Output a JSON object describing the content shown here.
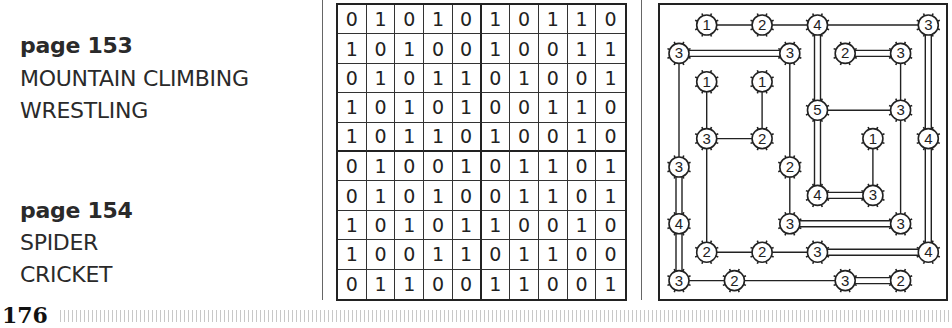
{
  "answers": [
    {
      "page_label": "page 153",
      "words": [
        "MOUNTAIN CLIMBING",
        "WRESTLING"
      ]
    },
    {
      "page_label": "page 154",
      "words": [
        "SPIDER",
        "CRICKET"
      ]
    }
  ],
  "binary_grid": [
    [
      "0",
      "1",
      "0",
      "1",
      "0",
      "1",
      "0",
      "1",
      "1",
      "0"
    ],
    [
      "1",
      "0",
      "1",
      "0",
      "0",
      "1",
      "0",
      "0",
      "1",
      "1"
    ],
    [
      "0",
      "1",
      "0",
      "1",
      "1",
      "0",
      "1",
      "0",
      "0",
      "1"
    ],
    [
      "1",
      "0",
      "1",
      "0",
      "1",
      "0",
      "0",
      "1",
      "1",
      "0"
    ],
    [
      "1",
      "0",
      "1",
      "1",
      "0",
      "1",
      "0",
      "0",
      "1",
      "0"
    ],
    [
      "0",
      "1",
      "0",
      "0",
      "1",
      "0",
      "1",
      "1",
      "0",
      "1"
    ],
    [
      "0",
      "1",
      "0",
      "1",
      "0",
      "0",
      "1",
      "1",
      "0",
      "1"
    ],
    [
      "1",
      "0",
      "1",
      "0",
      "1",
      "1",
      "0",
      "0",
      "1",
      "0"
    ],
    [
      "1",
      "0",
      "0",
      "1",
      "1",
      "0",
      "1",
      "1",
      "0",
      "0"
    ],
    [
      "0",
      "1",
      "1",
      "0",
      "0",
      "1",
      "1",
      "0",
      "0",
      "1"
    ]
  ],
  "bridges_puzzle": {
    "nodes": [
      {
        "id": "a",
        "col": 1,
        "row": 0,
        "value": "1"
      },
      {
        "id": "b",
        "col": 3,
        "row": 0,
        "value": "2"
      },
      {
        "id": "c",
        "col": 5,
        "row": 0,
        "value": "4"
      },
      {
        "id": "d",
        "col": 9,
        "row": 0,
        "value": "3"
      },
      {
        "id": "e",
        "col": 0,
        "row": 1,
        "value": "3"
      },
      {
        "id": "f",
        "col": 4,
        "row": 1,
        "value": "3"
      },
      {
        "id": "g",
        "col": 6,
        "row": 1,
        "value": "2"
      },
      {
        "id": "h",
        "col": 8,
        "row": 1,
        "value": "3"
      },
      {
        "id": "i",
        "col": 1,
        "row": 2,
        "value": "1"
      },
      {
        "id": "j",
        "col": 3,
        "row": 2,
        "value": "1"
      },
      {
        "id": "k",
        "col": 5,
        "row": 3,
        "value": "5"
      },
      {
        "id": "l",
        "col": 8,
        "row": 3,
        "value": "3"
      },
      {
        "id": "m",
        "col": 1,
        "row": 4,
        "value": "3"
      },
      {
        "id": "n",
        "col": 3,
        "row": 4,
        "value": "2"
      },
      {
        "id": "o",
        "col": 7,
        "row": 4,
        "value": "1"
      },
      {
        "id": "p",
        "col": 9,
        "row": 4,
        "value": "4"
      },
      {
        "id": "q",
        "col": 0,
        "row": 5,
        "value": "3"
      },
      {
        "id": "r",
        "col": 4,
        "row": 5,
        "value": "2"
      },
      {
        "id": "s",
        "col": 5,
        "row": 6,
        "value": "4"
      },
      {
        "id": "t",
        "col": 7,
        "row": 6,
        "value": "3"
      },
      {
        "id": "u",
        "col": 0,
        "row": 7,
        "value": "4"
      },
      {
        "id": "v",
        "col": 4,
        "row": 7,
        "value": "3"
      },
      {
        "id": "w",
        "col": 8,
        "row": 7,
        "value": "3"
      },
      {
        "id": "x",
        "col": 1,
        "row": 8,
        "value": "2"
      },
      {
        "id": "y",
        "col": 3,
        "row": 8,
        "value": "2"
      },
      {
        "id": "z",
        "col": 5,
        "row": 8,
        "value": "3"
      },
      {
        "id": "aa",
        "col": 9,
        "row": 8,
        "value": "4"
      },
      {
        "id": "ab",
        "col": 0,
        "row": 9,
        "value": "3"
      },
      {
        "id": "ac",
        "col": 2,
        "row": 9,
        "value": "2"
      },
      {
        "id": "ad",
        "col": 6,
        "row": 9,
        "value": "3"
      },
      {
        "id": "ae",
        "col": 8,
        "row": 9,
        "value": "2"
      }
    ],
    "bridges": [
      {
        "from": "a",
        "to": "b",
        "count": 1
      },
      {
        "from": "b",
        "to": "c",
        "count": 1
      },
      {
        "from": "c",
        "to": "d",
        "count": 1
      },
      {
        "from": "e",
        "to": "f",
        "count": 2
      },
      {
        "from": "g",
        "to": "h",
        "count": 2
      },
      {
        "from": "c",
        "to": "k",
        "count": 2
      },
      {
        "from": "d",
        "to": "p",
        "count": 2
      },
      {
        "from": "i",
        "to": "m",
        "count": 1
      },
      {
        "from": "j",
        "to": "n",
        "count": 1
      },
      {
        "from": "m",
        "to": "n",
        "count": 1
      },
      {
        "from": "k",
        "to": "l",
        "count": 1
      },
      {
        "from": "h",
        "to": "l",
        "count": 1
      },
      {
        "from": "e",
        "to": "q",
        "count": 1
      },
      {
        "from": "f",
        "to": "r",
        "count": 1
      },
      {
        "from": "m",
        "to": "x",
        "count": 1
      },
      {
        "from": "k",
        "to": "s",
        "count": 2
      },
      {
        "from": "o",
        "to": "t",
        "count": 1
      },
      {
        "from": "l",
        "to": "w",
        "count": 1
      },
      {
        "from": "p",
        "to": "aa",
        "count": 2
      },
      {
        "from": "q",
        "to": "u",
        "count": 2
      },
      {
        "from": "r",
        "to": "v",
        "count": 1
      },
      {
        "from": "s",
        "to": "t",
        "count": 2
      },
      {
        "from": "u",
        "to": "ab",
        "count": 2
      },
      {
        "from": "v",
        "to": "w",
        "count": 2
      },
      {
        "from": "x",
        "to": "y",
        "count": 1
      },
      {
        "from": "y",
        "to": "z",
        "count": 1
      },
      {
        "from": "z",
        "to": "aa",
        "count": 2
      },
      {
        "from": "ab",
        "to": "ac",
        "count": 1
      },
      {
        "from": "ac",
        "to": "ad",
        "count": 1
      },
      {
        "from": "ad",
        "to": "ae",
        "count": 2
      }
    ]
  },
  "footer": {
    "page_number": "176"
  }
}
